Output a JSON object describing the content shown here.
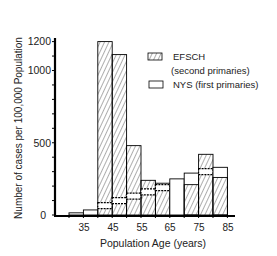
{
  "chart_data": {
    "type": "bar",
    "title": "",
    "xlabel": "Population Age (years)",
    "ylabel": "Number of cases per 100,000 Population",
    "ylim": [
      0,
      1200
    ],
    "yticks_labeled": [
      0,
      500,
      1000,
      1200
    ],
    "ytick_minor_step": 100,
    "xticks_labeled": [
      "35",
      "45",
      "55",
      "65",
      "75",
      "85"
    ],
    "grid": false,
    "legend_position": "upper right",
    "bins": [
      "30-35",
      "35-40",
      "40-45",
      "45-50",
      "50-55",
      "55-60",
      "60-65",
      "65-70",
      "70-75",
      "75-80",
      "80-85"
    ],
    "bin_edges": [
      30,
      35,
      40,
      45,
      50,
      55,
      60,
      65,
      70,
      75,
      80,
      85
    ],
    "series": [
      {
        "name": "EFSCH (second primaries)",
        "pattern": "hatched",
        "values": [
          0,
          0,
          1200,
          1110,
          480,
          240,
          220,
          0,
          210,
          420,
          260
        ]
      },
      {
        "name": "NYS (first primaries)",
        "pattern": "open",
        "values": [
          15,
          35,
          65,
          100,
          130,
          160,
          190,
          250,
          290,
          300,
          330
        ]
      }
    ]
  },
  "legend": {
    "items": [
      {
        "label": "EFSCH",
        "sublabel": "(second primaries)",
        "pattern": "hatched"
      },
      {
        "label": "NYS (first primaries)",
        "pattern": "open"
      }
    ]
  },
  "axes": {
    "x_title": "Population Age (years)",
    "y_title": "Number of cases per 100,000 Population",
    "y_labels": [
      "1200",
      "1000",
      "500",
      "0"
    ],
    "x_labels": [
      "35",
      "45",
      "55",
      "65",
      "75",
      "85"
    ]
  }
}
